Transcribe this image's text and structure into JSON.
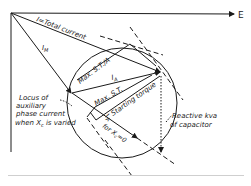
{
  "figure": {
    "axis_label": "E",
    "labels": {
      "total_current": "I=Total current",
      "im": "I",
      "im_sub": "M",
      "ia": "I",
      "ia_sub": "A",
      "max_st_a": "Max. S.T./A",
      "max_st": "Max. S.T.",
      "starting_torque": "Starting torque",
      "ia_xc0": "I",
      "ia_xc0_sub": "A",
      "for_xc0": "for X",
      "for_xc0_sub": "c",
      "for_xc0_tail": "=0",
      "locus_line1": "Locus of",
      "locus_line2": "auxiliary",
      "locus_line3": "phase current",
      "locus_line4": "when X",
      "locus_line4_sub": "c",
      "locus_line4_tail": " is varied",
      "reactive_line1": "Reactive kva",
      "reactive_line2": "of capacitor"
    },
    "colors": {
      "ink": "#1a1a1a",
      "background": "#ffffff",
      "rule": "#cfcfcf"
    }
  }
}
